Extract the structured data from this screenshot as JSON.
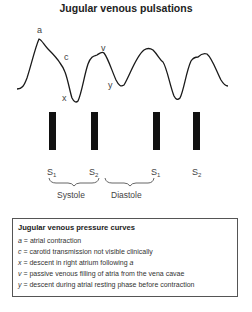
{
  "title": "Jugular venous pulsations",
  "wave_labels": {
    "a": "a",
    "c": "c",
    "x": "x",
    "v": "v",
    "y": "y"
  },
  "heart_sounds": [
    {
      "label": "S",
      "sub": "1"
    },
    {
      "label": "S",
      "sub": "2"
    },
    {
      "label": "S",
      "sub": "1"
    },
    {
      "label": "S",
      "sub": "2"
    }
  ],
  "phases": {
    "systole": "Systole",
    "diastole": "Diastole"
  },
  "legend": {
    "title": "Jugular venous pressure curves",
    "items": [
      {
        "key": "a",
        "text": " = atrial contraction"
      },
      {
        "key": "c",
        "text": " = carotid transmission not visible clinically"
      },
      {
        "key": "x",
        "text": " = descent in right atrium following ",
        "tail": "a"
      },
      {
        "key": "v",
        "text": " = passive venous filling of atria from the vena cavae"
      },
      {
        "key": "y",
        "text": " = descent during atrial resting phase before contraction"
      }
    ]
  },
  "colors": {
    "line": "#1a1a1a",
    "bar": "#111111"
  }
}
